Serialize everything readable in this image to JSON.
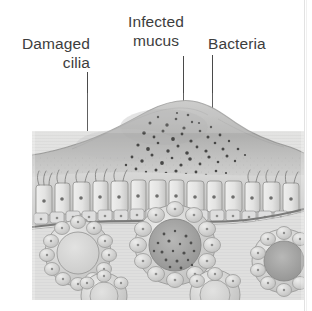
{
  "figure": {
    "kind": "histology-illustration",
    "palette": {
      "page_background": "#ffffff",
      "label_text": "#3d3d3d",
      "leader_line": "#4a4a4a",
      "tissue_light": "#e7e7e6",
      "tissue_mid": "#c9c9c8",
      "tissue_dark": "#9a9a99",
      "mucus_fill": "#b9b9b8",
      "bacteria_dot": "#4a4a4a",
      "membrane_line": "#7d7d7c",
      "lamina_propria": "#dedede",
      "page_rule": "#e2e2e2"
    }
  },
  "labels": {
    "damaged_cilia": "Damaged\ncilia",
    "infected_mucus": "Infected\nmucus",
    "bacteria": "Bacteria"
  },
  "leaders": {
    "damaged_cilia": {
      "x": 87,
      "y_top": 72,
      "length": 97
    },
    "infected_mucus": {
      "x": 183,
      "y_top": 56,
      "length": 47
    },
    "bacteria": {
      "x": 212,
      "y_top": 55,
      "length": 72
    }
  },
  "illustration": {
    "bounds": {
      "x": 32,
      "y": 93,
      "width": 272,
      "height": 207
    },
    "layers": [
      {
        "name": "infected-mucus-dome",
        "note": "thick raised mucus plaque over epithelium, speckled with bacteria"
      },
      {
        "name": "ciliated-columnar-epithelium",
        "note": "row of tall columnar cells with short sparse damaged cilia tufts"
      },
      {
        "name": "basement-membrane",
        "note": "dark sloping line beneath epithelium"
      },
      {
        "name": "lamina-propria",
        "note": "pale stippled connective tissue"
      },
      {
        "name": "submucosal-glands",
        "note": "three acini on ducts; centre acinus packed with dark infected secretion"
      }
    ],
    "glands": [
      {
        "id": "gland-left",
        "cx": 46,
        "cy": 160,
        "r": 35,
        "lumen": "clear"
      },
      {
        "id": "gland-centre",
        "cx": 143,
        "cy": 152,
        "r": 41,
        "lumen": "infected-speckled"
      },
      {
        "id": "gland-right",
        "cx": 248,
        "cy": 168,
        "r": 33,
        "lumen": "infected-speckled"
      },
      {
        "id": "gland-partial-lower-left",
        "cx": 70,
        "cy": 200,
        "r": 24,
        "lumen": "clear"
      },
      {
        "id": "gland-partial-lower-centre",
        "cx": 178,
        "cy": 197,
        "r": 26,
        "lumen": "clear"
      }
    ]
  }
}
